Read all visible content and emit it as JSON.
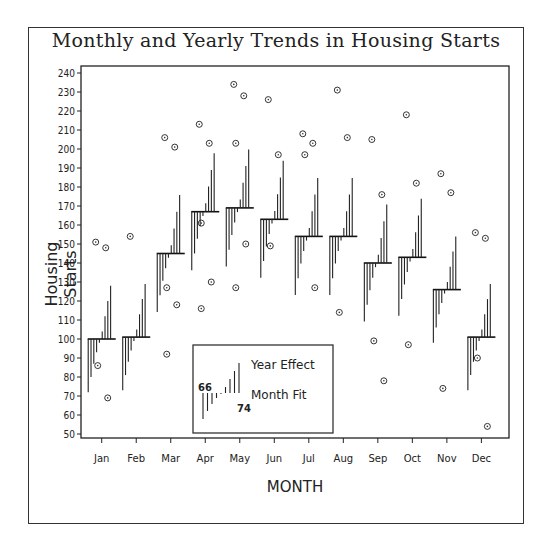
{
  "chart_data": {
    "type": "line",
    "title": "Monthly and Yearly Trends in Housing Starts",
    "xlabel": "MONTH",
    "ylabel": "Housing Starts",
    "ylim": [
      50,
      240
    ],
    "yticks": [
      50,
      60,
      70,
      80,
      90,
      100,
      110,
      120,
      130,
      140,
      150,
      160,
      170,
      180,
      190,
      200,
      210,
      220,
      230,
      240
    ],
    "categories": [
      "Jan",
      "Feb",
      "Mar",
      "Apr",
      "May",
      "Jun",
      "Jul",
      "Aug",
      "Sep",
      "Oct",
      "Nov",
      "Dec"
    ],
    "month_fit": [
      100,
      101,
      145,
      167,
      169,
      163,
      154,
      154,
      140,
      143,
      126,
      101
    ],
    "year_labels": [
      "66",
      "67",
      "68",
      "69",
      "70",
      "71",
      "72",
      "73",
      "74"
    ],
    "year_effect": [
      -28,
      -20,
      -13,
      -7,
      -2,
      4,
      12,
      20,
      28
    ],
    "outliers": {
      "Jan": [
        151,
        148,
        86,
        69
      ],
      "Feb": [
        154
      ],
      "Mar": [
        206,
        201,
        127,
        118,
        92
      ],
      "Apr": [
        213,
        203,
        161,
        130,
        116
      ],
      "May": [
        234,
        228,
        203,
        150,
        127
      ],
      "Jun": [
        226,
        197,
        149
      ],
      "Jul": [
        208,
        203,
        197,
        127
      ],
      "Aug": [
        231,
        206,
        114
      ],
      "Sep": [
        205,
        176,
        99,
        78
      ],
      "Oct": [
        218,
        182,
        97
      ],
      "Nov": [
        187,
        177,
        74
      ],
      "Dec": [
        156,
        153,
        90,
        54
      ]
    },
    "legend": {
      "year_effect_label": "Year Effect",
      "month_fit_label": "Month Fit",
      "first_year": "66",
      "last_year": "74"
    },
    "grid": false
  }
}
